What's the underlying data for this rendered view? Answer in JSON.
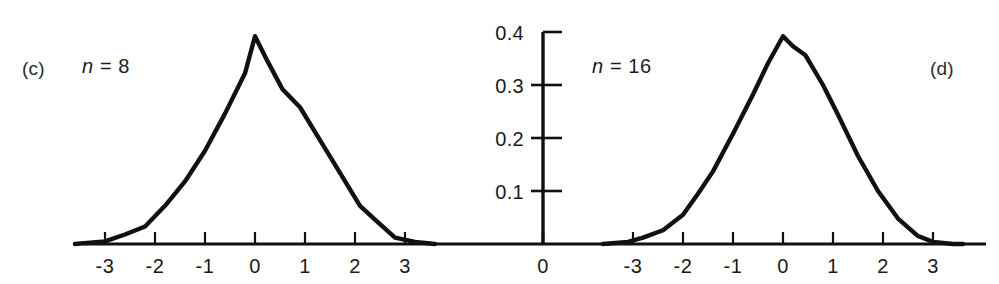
{
  "figure": {
    "background_color": "#ffffff",
    "ink_color": "#111111",
    "width": 999,
    "height": 284
  },
  "panels": [
    {
      "letter": "(c)",
      "n_label": "n = 8",
      "n_symbol": "n",
      "n_equals": "=",
      "n_value": "8"
    },
    {
      "letter": "(d)",
      "n_label": "n = 16",
      "n_symbol": "n",
      "n_equals": "=",
      "n_value": "16"
    }
  ],
  "chart_data": [
    {
      "type": "line",
      "title": "n = 8",
      "panel": "(c)",
      "xlabel": "",
      "ylabel": "",
      "xlim": [
        -3.6,
        3.6
      ],
      "ylim": [
        0,
        0.4
      ],
      "grid": false,
      "legend": "none",
      "xticks": [
        -3,
        -2,
        -1,
        0,
        1,
        2,
        3
      ],
      "xtick_labels": [
        "-3",
        "-2",
        "-1",
        "0",
        "1",
        "2",
        "3"
      ],
      "yticks": [],
      "ytick_labels": [],
      "yaxis_visible": false,
      "annotations": [
        "(c)",
        "n = 8"
      ],
      "x": [
        -3.6,
        -3.0,
        -2.6,
        -2.2,
        -1.8,
        -1.4,
        -1.0,
        -0.6,
        -0.2,
        0.0,
        0.25,
        0.55,
        0.9,
        1.3,
        1.7,
        2.1,
        2.4,
        2.8,
        3.2,
        3.6
      ],
      "values": [
        0.0,
        0.005,
        0.018,
        0.033,
        0.072,
        0.118,
        0.176,
        0.246,
        0.322,
        0.392,
        0.345,
        0.292,
        0.258,
        0.196,
        0.134,
        0.072,
        0.046,
        0.012,
        0.004,
        0.0
      ]
    },
    {
      "type": "line",
      "title": "n = 16",
      "panel": "(d)",
      "xlabel": "",
      "ylabel": "",
      "xlim": [
        -3.6,
        3.6
      ],
      "ylim": [
        0,
        0.4
      ],
      "grid": false,
      "legend": "none",
      "xticks": [
        -3,
        -2,
        -1,
        0,
        1,
        2,
        3
      ],
      "xtick_labels": [
        "-3",
        "-2",
        "-1",
        "0",
        "1",
        "2",
        "3"
      ],
      "yticks": [
        0,
        0.1,
        0.2,
        0.3,
        0.4
      ],
      "ytick_labels": [
        "0",
        "0.1",
        "0.2",
        "0.3",
        "0.4"
      ],
      "yaxis_visible": true,
      "yaxis_origin_label": "0",
      "annotations": [
        "(d)",
        "n = 16"
      ],
      "x": [
        -3.6,
        -3.1,
        -2.8,
        -2.4,
        -2.0,
        -1.7,
        -1.4,
        -1.0,
        -0.6,
        -0.3,
        0.0,
        0.2,
        0.45,
        0.8,
        1.1,
        1.5,
        1.9,
        2.3,
        2.7,
        3.0,
        3.4,
        3.6
      ],
      "values": [
        0.0,
        0.004,
        0.012,
        0.026,
        0.055,
        0.095,
        0.137,
        0.208,
        0.282,
        0.341,
        0.392,
        0.373,
        0.356,
        0.3,
        0.244,
        0.166,
        0.1,
        0.048,
        0.015,
        0.004,
        0.0,
        0.0
      ]
    }
  ]
}
